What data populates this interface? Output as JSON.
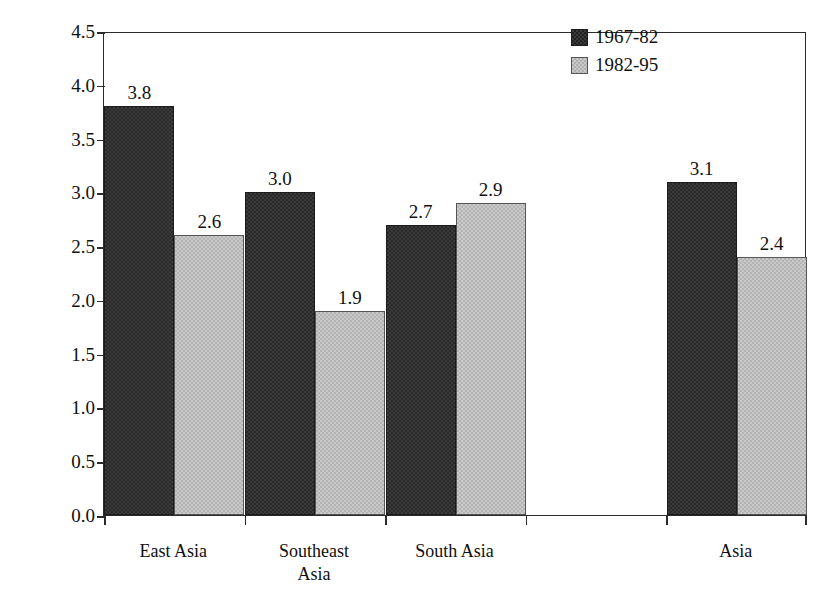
{
  "chart_data": {
    "type": "bar",
    "title": "",
    "xlabel": "",
    "ylabel": "percent per year",
    "ylim": [
      0.0,
      4.5
    ],
    "ytick_labels": [
      "0.0",
      "0.5",
      "1.0",
      "1.5",
      "2.0",
      "2.5",
      "3.0",
      "3.5",
      "4.0",
      "4.5"
    ],
    "ytick_values": [
      0.0,
      0.5,
      1.0,
      1.5,
      2.0,
      2.5,
      3.0,
      3.5,
      4.0,
      4.5
    ],
    "grid": false,
    "legend_position": "top-right",
    "categories": [
      "East Asia",
      "Southeast Asia",
      "South Asia",
      "",
      "Asia"
    ],
    "category_lines": [
      [
        "East Asia"
      ],
      [
        "Southeast",
        "Asia"
      ],
      [
        "South Asia"
      ],
      [
        ""
      ],
      [
        "Asia"
      ]
    ],
    "series": [
      {
        "name": "1967-82",
        "color": "#3a3a3a",
        "values": [
          3.8,
          3.0,
          2.7,
          null,
          3.1
        ],
        "labels": [
          "3.8",
          "3.0",
          "2.7",
          "",
          "3.1"
        ]
      },
      {
        "name": "1982-95",
        "color": "#c8c8c8",
        "values": [
          2.6,
          1.9,
          2.9,
          null,
          2.4
        ],
        "labels": [
          "2.6",
          "1.9",
          "2.9",
          "",
          "2.4"
        ]
      }
    ]
  },
  "legend": {
    "entries": [
      {
        "label": "1967-82",
        "swatch": "dark"
      },
      {
        "label": "1982-95",
        "swatch": "light"
      }
    ]
  },
  "axes": {
    "y_title": "percent per year"
  }
}
